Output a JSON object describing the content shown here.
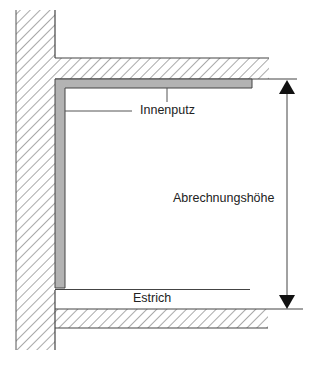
{
  "diagram": {
    "type": "section-drawing",
    "labels": {
      "inner_plaster": "Innenputz",
      "billing_height": "Abrechnungshöhe",
      "screed": "Estrich"
    },
    "colors": {
      "line": "#444444",
      "hatch": "#555555",
      "plaster_fill": "#b3b3b3",
      "background": "#ffffff"
    },
    "elements": [
      {
        "id": "wall",
        "kind": "hatched-masonry-wall"
      },
      {
        "id": "ceiling-slab",
        "kind": "hatched-slab"
      },
      {
        "id": "floor-slab",
        "kind": "hatched-slab"
      },
      {
        "id": "inner-plaster",
        "kind": "plaster-layer",
        "label_ref": "inner_plaster"
      },
      {
        "id": "screed",
        "kind": "screed-layer",
        "label_ref": "screed"
      },
      {
        "id": "height-dimension",
        "kind": "double-arrow-dimension",
        "label_ref": "billing_height"
      }
    ]
  }
}
